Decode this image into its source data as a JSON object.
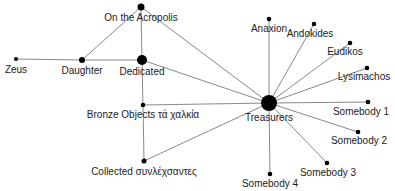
{
  "diagram": {
    "type": "network-graph",
    "nodes": [
      {
        "id": "acropolis",
        "label": "On the Acropolis",
        "x": 141,
        "y": 7,
        "r": 3.5,
        "lx": 141,
        "ly": 21,
        "anchor": "middle"
      },
      {
        "id": "zeus",
        "label": "Zeus",
        "x": 16,
        "y": 59,
        "r": 2,
        "lx": 16,
        "ly": 73,
        "anchor": "middle"
      },
      {
        "id": "daughter",
        "label": "Daughter",
        "x": 82,
        "y": 60,
        "r": 3,
        "lx": 82,
        "ly": 74,
        "anchor": "middle"
      },
      {
        "id": "dedicated",
        "label": "Dedicated",
        "x": 142,
        "y": 60,
        "r": 5,
        "lx": 142,
        "ly": 75,
        "anchor": "middle"
      },
      {
        "id": "bronze",
        "label": "Bronze Objects τά χαλκία",
        "x": 143,
        "y": 105,
        "r": 2.3,
        "lx": 143,
        "ly": 118,
        "anchor": "middle"
      },
      {
        "id": "collected",
        "label": "Collected συνλέχσαντες",
        "x": 144,
        "y": 161,
        "r": 2.5,
        "lx": 144,
        "ly": 175,
        "anchor": "middle"
      },
      {
        "id": "treasurers",
        "label": "Treasurers",
        "x": 269,
        "y": 103,
        "r": 8,
        "lx": 269,
        "ly": 121,
        "anchor": "middle"
      },
      {
        "id": "anaxion",
        "label": "Anaxion",
        "x": 269,
        "y": 19,
        "r": 2.3,
        "lx": 269,
        "ly": 32,
        "anchor": "middle"
      },
      {
        "id": "andokides",
        "label": "Andokides",
        "x": 314,
        "y": 24,
        "r": 2.3,
        "lx": 310,
        "ly": 37,
        "anchor": "middle"
      },
      {
        "id": "eudikos",
        "label": "Eudikos",
        "x": 350,
        "y": 43,
        "r": 2.3,
        "lx": 345,
        "ly": 55,
        "anchor": "middle"
      },
      {
        "id": "lysimachos",
        "label": "Lysimachos",
        "x": 367,
        "y": 68,
        "r": 2.3,
        "lx": 364,
        "ly": 80,
        "anchor": "middle"
      },
      {
        "id": "somebody1",
        "label": "Somebody 1",
        "x": 368,
        "y": 102,
        "r": 2.3,
        "lx": 361,
        "ly": 115,
        "anchor": "middle"
      },
      {
        "id": "somebody2",
        "label": "Somebody 2",
        "x": 358,
        "y": 132,
        "r": 2.3,
        "lx": 359,
        "ly": 144,
        "anchor": "middle"
      },
      {
        "id": "somebody3",
        "label": "Somebody 3",
        "x": 327,
        "y": 163,
        "r": 2.3,
        "lx": 328,
        "ly": 176,
        "anchor": "middle"
      },
      {
        "id": "somebody4",
        "label": "Somebody 4",
        "x": 270,
        "y": 174,
        "r": 2.3,
        "lx": 270,
        "ly": 187,
        "anchor": "middle"
      }
    ],
    "edges": [
      [
        "zeus",
        "daughter"
      ],
      [
        "daughter",
        "dedicated"
      ],
      [
        "daughter",
        "acropolis"
      ],
      [
        "acropolis",
        "dedicated"
      ],
      [
        "acropolis",
        "treasurers"
      ],
      [
        "dedicated",
        "treasurers"
      ],
      [
        "dedicated",
        "bronze"
      ],
      [
        "bronze",
        "treasurers"
      ],
      [
        "bronze",
        "collected"
      ],
      [
        "collected",
        "treasurers"
      ],
      [
        "treasurers",
        "anaxion"
      ],
      [
        "treasurers",
        "andokides"
      ],
      [
        "treasurers",
        "eudikos"
      ],
      [
        "treasurers",
        "lysimachos"
      ],
      [
        "treasurers",
        "somebody1"
      ],
      [
        "treasurers",
        "somebody2"
      ],
      [
        "treasurers",
        "somebody3"
      ],
      [
        "treasurers",
        "somebody4"
      ]
    ],
    "colors": {
      "node": "#000000",
      "edge": "#7a7a7a",
      "label": "#222222",
      "background": "#ffffff"
    }
  }
}
